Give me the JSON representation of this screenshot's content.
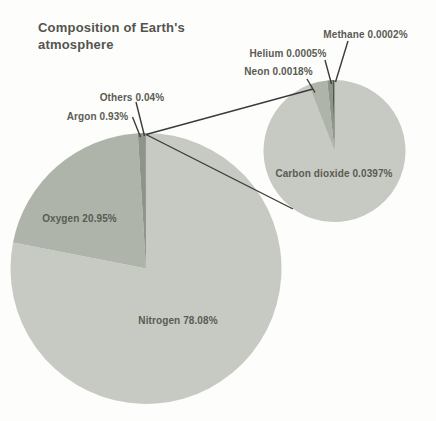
{
  "chart_data": [
    {
      "id": "atmosphere-main",
      "type": "pie",
      "title": "Composition of Earth's atmosphere",
      "unit": "%",
      "start_angle_deg": 0,
      "direction": "clockwise",
      "slices": [
        {
          "label": "Nitrogen",
          "value": 78.08,
          "display": "Nitrogen 78.08%",
          "color": "#c6cac2"
        },
        {
          "label": "Oxygen",
          "value": 20.95,
          "display": "Oxygen 20.95%",
          "color": "#aeb4a9"
        },
        {
          "label": "Argon",
          "value": 0.93,
          "display": "Argon 0.93%",
          "color": "#8e948a"
        },
        {
          "label": "Others",
          "value": 0.04,
          "display": "Others 0.04%",
          "color": "#5f6359"
        }
      ]
    },
    {
      "id": "others-breakdown",
      "type": "pie",
      "parent_slice": "Others",
      "unit": "%",
      "start_angle_deg": 0,
      "direction": "clockwise",
      "slices": [
        {
          "label": "Carbon dioxide",
          "value": 0.0397,
          "display": "Carbon dioxide 0.0397%",
          "color": "#c6cac2"
        },
        {
          "label": "Neon",
          "value": 0.0018,
          "display": "Neon 0.0018%",
          "color": "#aeb4a9"
        },
        {
          "label": "Helium",
          "value": 0.0005,
          "display": "Helium 0.0005%",
          "color": "#8e948a"
        },
        {
          "label": "Methane",
          "value": 0.0002,
          "display": "Methane 0.0002%",
          "color": "#50544b"
        }
      ]
    }
  ],
  "colors": {
    "background": "#fdfdfc",
    "leader_line": "#3b3b39",
    "title_text": "#53544e",
    "label_text": "#5a5b53"
  }
}
